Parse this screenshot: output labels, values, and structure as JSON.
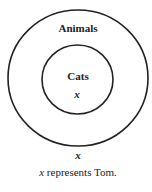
{
  "diagram": {
    "type": "euler-diagram",
    "outer_set": {
      "label": "Animals"
    },
    "inner_set": {
      "label": "Cats"
    },
    "inner_element": "x",
    "outer_element": "x",
    "caption": {
      "variable": "x",
      "text": " represents Tom."
    }
  }
}
